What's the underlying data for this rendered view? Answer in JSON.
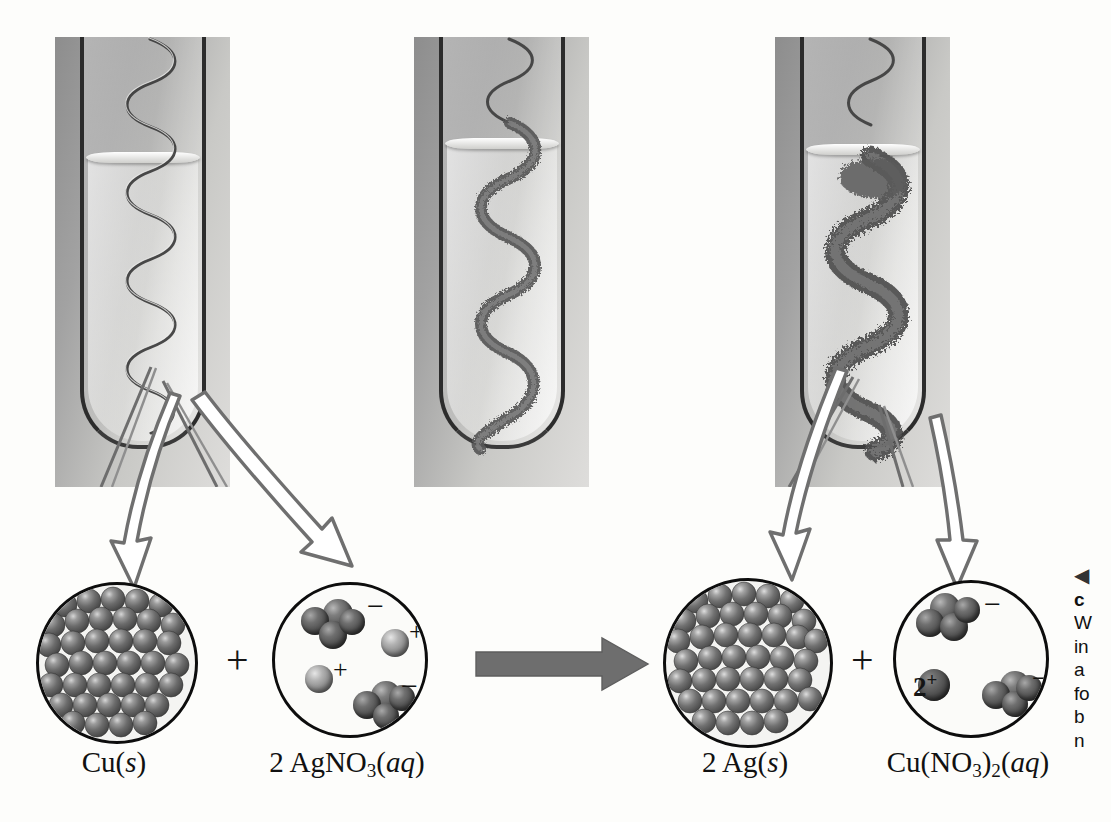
{
  "figure": {
    "kind": "chemistry-reaction-figure",
    "reaction_summary": "Cu(s) + 2 AgNO3(aq) -> 2 Ag(s) + Cu(NO3)2(aq)"
  },
  "photos": [
    {
      "name": "copper-coil-before",
      "alt": "Shiny copper wire coil in colorless silver nitrate solution at start of reaction",
      "state": "before",
      "coating": "none"
    },
    {
      "name": "copper-coil-during",
      "alt": "Copper coil partially coated with gray silver crystals, solution beginning to tint",
      "state": "during",
      "coating": "partial"
    },
    {
      "name": "copper-coil-after",
      "alt": "Copper coil heavily encrusted with fuzzy silver crystals, solution colored by copper ions",
      "state": "after",
      "coating": "heavy"
    }
  ],
  "insets": [
    {
      "name": "cu-solid-inset",
      "label_html": "Cu(<i>s</i>)",
      "description": "Close-packed lattice of copper atoms",
      "kind": "metal-lattice"
    },
    {
      "name": "agno3-solution-inset",
      "label_html": "2 AgNO<sub>3</sub>(<i>aq</i>)",
      "description": "Two silver ions and two nitrate ions dissolved in water",
      "kind": "solution",
      "ions": [
        {
          "species": "NO3",
          "charge": "−",
          "count": 2
        },
        {
          "species": "Ag",
          "charge": "+",
          "count": 2
        }
      ]
    },
    {
      "name": "ag-solid-inset",
      "label_html": "2 Ag(<i>s</i>)",
      "description": "Close-packed lattice of silver atoms deposited on the wire",
      "kind": "metal-lattice"
    },
    {
      "name": "cuno32-solution-inset",
      "label_html": "Cu(NO<sub>3</sub>)<sub>2</sub>(<i>aq</i>)",
      "description": "One copper(II) ion and two nitrate ions dissolved in water",
      "kind": "solution",
      "ions": [
        {
          "species": "NO3",
          "charge": "−",
          "count": 2
        },
        {
          "species": "Cu",
          "charge": "2+",
          "count": 1
        }
      ]
    }
  ],
  "operators": {
    "plus_left": "+",
    "plus_right": "+",
    "reaction_arrow": "yields-arrow"
  },
  "charges": {
    "minus": "−",
    "plus": "+",
    "two_plus_number": "2",
    "two_plus_sign": "+"
  },
  "caption": {
    "marker": "◀",
    "title": "c",
    "lines": [
      "W",
      "in",
      "a",
      "fo",
      "b",
      "n"
    ]
  },
  "colors": {
    "page_background": "#fdfdfb",
    "photo_background": "#a8a8a6",
    "ink": "#111111",
    "reaction_arrow": "#6e6e6e",
    "callout_arrow_outline": "#6f6f6f",
    "inset_outline": "#0d0d0d"
  }
}
